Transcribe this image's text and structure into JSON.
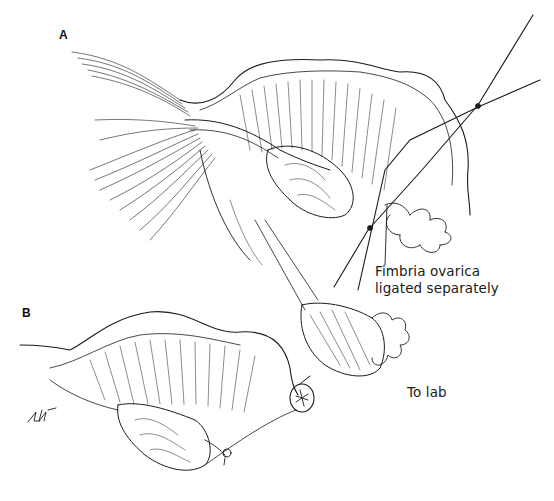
{
  "figure": {
    "panels": [
      {
        "id": "A",
        "letter": "A"
      },
      {
        "id": "B",
        "letter": "B"
      }
    ],
    "annotations": {
      "fimbria": {
        "line1": "Fimbria ovarica",
        "line2": "ligated separately"
      },
      "to_lab": "To lab"
    },
    "signature": "LAV",
    "colors": {
      "ink": "#1a1a1a",
      "background": "#ffffff"
    }
  }
}
